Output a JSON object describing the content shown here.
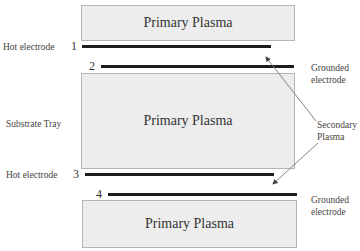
{
  "diagram": {
    "boxes": [
      {
        "id": "top",
        "label": "Primary Plasma"
      },
      {
        "id": "middle",
        "label": "Primary Plasma"
      },
      {
        "id": "bottom",
        "label": "Primary Plasma"
      }
    ],
    "electrodes": [
      {
        "number": "1",
        "type": "Hot electrode"
      },
      {
        "number": "2",
        "type": "Grounded electrode"
      },
      {
        "number": "3",
        "type": "Hot electrode"
      },
      {
        "number": "4",
        "type": "Grounded electrode"
      }
    ],
    "labels": {
      "hot_electrode_1": "Hot electrode",
      "hot_electrode_3": "Hot electrode",
      "substrate_tray": "Substrate Tray",
      "grounded_electrode_2_line1": "Grounded",
      "grounded_electrode_2_line2": "electrode",
      "grounded_electrode_4_line1": "Grounded",
      "grounded_electrode_4_line2": "electrode",
      "secondary_plasma_line1": "Secondary",
      "secondary_plasma_line2": "Plasma"
    },
    "colors": {
      "box_fill": "#ededed",
      "box_border": "#b5b5b5",
      "electrode": "#1c1c1c",
      "arrow": "#555555"
    }
  }
}
